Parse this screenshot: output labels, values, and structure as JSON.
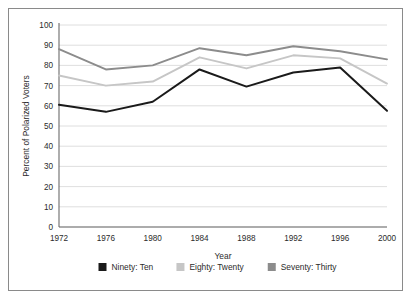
{
  "chart_data": {
    "type": "line",
    "title": "",
    "xlabel": "Year",
    "ylabel": "Percent of Polarized Voters",
    "categories": [
      "1972",
      "1976",
      "1980",
      "1984",
      "1988",
      "1992",
      "1996",
      "2000"
    ],
    "x": [
      1972,
      1976,
      1980,
      1984,
      1988,
      1992,
      1996,
      2000
    ],
    "xlim": [
      1972,
      2000
    ],
    "ylim": [
      0,
      100
    ],
    "yticks": [
      0,
      10,
      20,
      30,
      40,
      50,
      60,
      70,
      80,
      90,
      100
    ],
    "ytick_labels": [
      "0",
      "10",
      "20",
      "30",
      "40",
      "50",
      "60",
      "70",
      "80",
      "90",
      "100"
    ],
    "grid": "horizontal",
    "legend_position": "bottom",
    "series": [
      {
        "name": "Ninety: Ten",
        "color": "#1a1a1a",
        "values": [
          60.5,
          57.0,
          62.0,
          78.0,
          69.5,
          76.5,
          79.0,
          57.5
        ]
      },
      {
        "name": "Eighty: Twenty",
        "color": "#c6c6c6",
        "values": [
          75.0,
          70.0,
          72.0,
          84.0,
          78.5,
          85.0,
          83.5,
          71.0
        ]
      },
      {
        "name": "Seventy: Thirty",
        "color": "#8c8c8c",
        "values": [
          88.0,
          78.0,
          80.0,
          88.5,
          85.0,
          89.5,
          87.0,
          83.0
        ]
      }
    ]
  },
  "figure": {
    "border_color": "#8a8a8a",
    "background": "#ffffff",
    "grid_color": "#d6d6d6",
    "axis_color": "#6b6b6b",
    "text_color": "#2b2b2b"
  }
}
